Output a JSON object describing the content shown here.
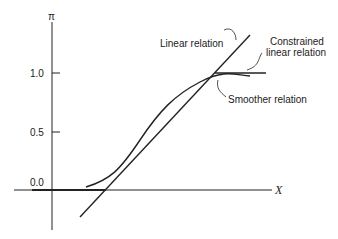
{
  "diagram": {
    "y_axis_label": "π",
    "x_axis_label": "X",
    "y_ticks": [
      "1.0",
      "0.5",
      "0.0"
    ],
    "curves": {
      "linear": "Linear relation",
      "constrained_line1": "Constrained",
      "constrained_line2": "linear relation",
      "smoother": "Smoother relation"
    }
  }
}
